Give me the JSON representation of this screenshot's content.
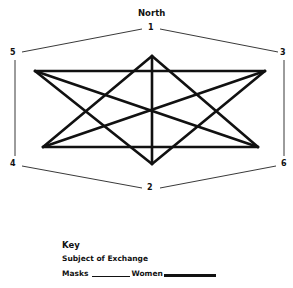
{
  "diagram": {
    "title": "North",
    "nodes": [
      {
        "id": "1",
        "label": "1"
      },
      {
        "id": "2",
        "label": "2"
      },
      {
        "id": "3",
        "label": "3"
      },
      {
        "id": "4",
        "label": "4"
      },
      {
        "id": "5",
        "label": "5"
      },
      {
        "id": "6",
        "label": "6"
      }
    ],
    "outer_ring": {
      "style": "thin",
      "order": [
        "1",
        "3",
        "6",
        "2",
        "4",
        "5"
      ]
    },
    "inner_figure": {
      "style": "thick",
      "vertices": {
        "top": [
          152,
          56
        ],
        "bottom": [
          152,
          164
        ],
        "top_left": [
          35,
          71
        ],
        "top_right": [
          265,
          71
        ],
        "bottom_left": [
          43,
          147
        ],
        "bottom_right": [
          258,
          147
        ]
      },
      "edges": [
        [
          "top_left",
          "top_right"
        ],
        [
          "bottom_left",
          "bottom_right"
        ],
        [
          "top",
          "bottom"
        ],
        [
          "top",
          "bottom_left"
        ],
        [
          "top",
          "bottom_right"
        ],
        [
          "bottom",
          "top_left"
        ],
        [
          "bottom",
          "top_right"
        ],
        [
          "top_left",
          "bottom_right"
        ],
        [
          "top_right",
          "bottom_left"
        ]
      ]
    }
  },
  "key": {
    "heading": "Key",
    "subtitle": "Subject of Exchange",
    "items": [
      {
        "label": "Masks",
        "line_style": "thin"
      },
      {
        "label": "Women",
        "line_style": "thick"
      }
    ]
  }
}
